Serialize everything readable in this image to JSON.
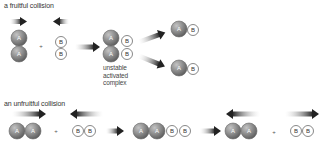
{
  "diagram": {
    "fruitful": {
      "title": "a fruitful collision",
      "reactant_a": [
        "A",
        "A"
      ],
      "plus": "+",
      "reactant_b": [
        "B",
        "B"
      ],
      "complex_label_lines": [
        "unstable",
        "activated",
        "complex"
      ],
      "products": [
        [
          "A",
          "B"
        ],
        [
          "A",
          "B"
        ]
      ]
    },
    "unfruitful": {
      "title": "an unfruitful collision",
      "reactant_a": [
        "A",
        "A"
      ],
      "plus": "+",
      "reactant_b": [
        "B",
        "B"
      ],
      "complex": [
        "A",
        "A",
        "B",
        "B"
      ],
      "result_a": [
        "A",
        "A"
      ],
      "plus2": "+",
      "result_b": [
        "B",
        "B"
      ]
    }
  },
  "colors": {
    "atom_a_fill": "#8a8a8a",
    "atom_a_stroke": "#666666",
    "atom_b_fill": "#ffffff",
    "atom_b_stroke": "#555555",
    "arrow": "#222222"
  }
}
